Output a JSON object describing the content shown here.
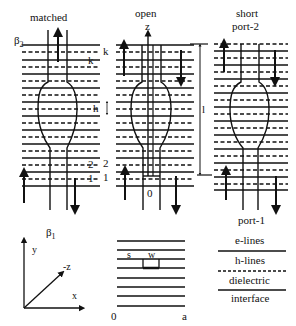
{
  "panels": [
    {
      "id": "matched",
      "title": "matched",
      "x": 22,
      "w": 78,
      "top_label": "β2"
    },
    {
      "id": "open",
      "title": "open",
      "x": 118,
      "w": 76,
      "axis_label": "z",
      "origin_label": "0"
    },
    {
      "id": "short",
      "title_lines": [
        "short",
        "port-2"
      ],
      "x": 214,
      "w": 76
    }
  ],
  "labels": {
    "matched": "matched",
    "open": "open",
    "short": "short",
    "port2": "port-2",
    "port1": "port-1",
    "beta2": "β",
    "beta2_sub": "2",
    "beta1": "β",
    "beta1_sub": "1",
    "k_left": "k",
    "k_mid": "k",
    "h": "h",
    "two": "2",
    "one_left": "1",
    "two_mid": "2",
    "one_mid": "1",
    "z": "z",
    "zero_mid": "0",
    "length": "l",
    "axis_y": "y",
    "axis_negz": "-z",
    "axis_x": "x",
    "s": "s",
    "w": "w",
    "zero_bottom": "0",
    "a": "a"
  },
  "legend": {
    "e_lines": "e-lines",
    "h_lines": "h-lines",
    "dielectric": "dielectric",
    "interface": "interface"
  },
  "colors": {
    "ink": "#111111",
    "background": "#ffffff"
  }
}
